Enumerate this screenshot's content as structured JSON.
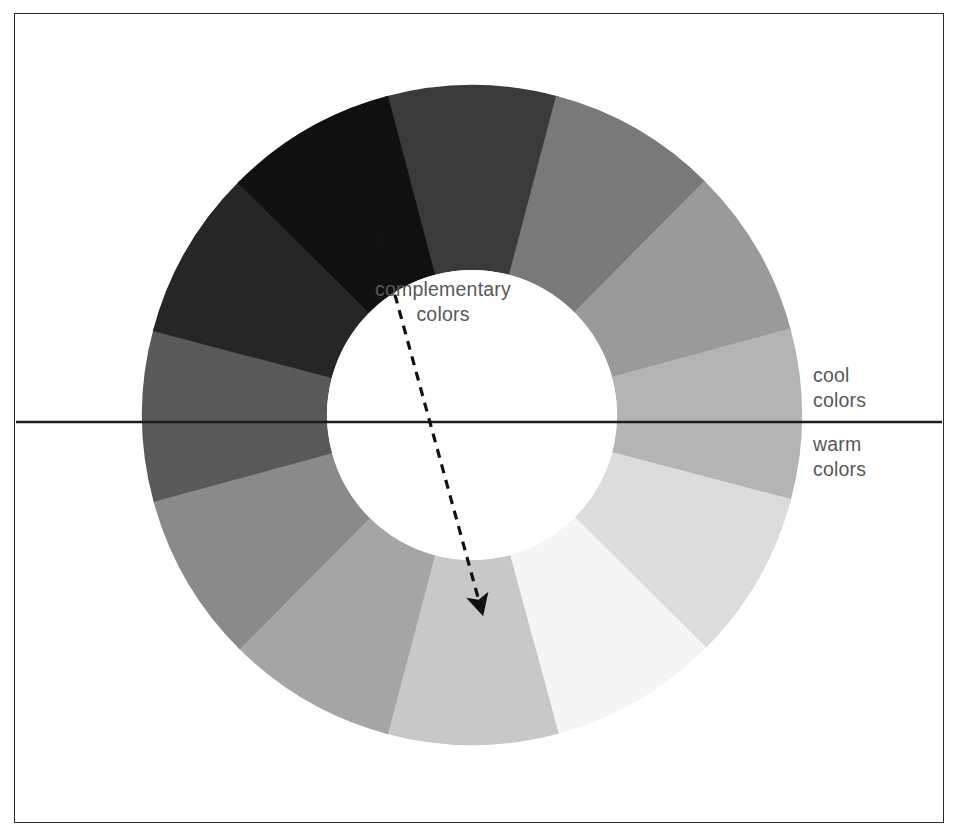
{
  "figure": {
    "background_color": "#ffffff",
    "frame_border_color": "#2b2b2b",
    "label_color": "#585858"
  },
  "labels": {
    "complementary": "complementary\ncolors",
    "cool": "cool\ncolors",
    "warm": "warm\ncolors"
  },
  "chart_data": {
    "type": "pie",
    "xlabel": "",
    "ylabel": "",
    "shape": "donut",
    "center": [
      472,
      415
    ],
    "outer_radius": 330,
    "inner_radius": 145,
    "segment_count": 12,
    "segment_span_degrees": 30,
    "start_angle_degrees": -105,
    "legend_position": "right",
    "grid": false,
    "categories": [
      "seg-1",
      "seg-2",
      "seg-3",
      "seg-4",
      "seg-5",
      "seg-6",
      "seg-7",
      "seg-8",
      "seg-9",
      "seg-10",
      "seg-11",
      "seg-12"
    ],
    "values": [
      30,
      30,
      30,
      30,
      30,
      30,
      30,
      30,
      30,
      30,
      30,
      30
    ],
    "segments": [
      {
        "index": 1,
        "name": "segment-top-left-dark",
        "color": "#3a3a3a",
        "start_deg": -105,
        "end_deg": -75
      },
      {
        "index": 2,
        "name": "segment-top",
        "color": "#797979",
        "start_deg": -75,
        "end_deg": -45
      },
      {
        "index": 3,
        "name": "segment-upper-right",
        "color": "#9a9a9a",
        "start_deg": -45,
        "end_deg": -15
      },
      {
        "index": 4,
        "name": "segment-right-upper",
        "color": "#b4b4b4",
        "start_deg": -15,
        "end_deg": 15
      },
      {
        "index": 5,
        "name": "segment-right-cool",
        "color": "#dcdcdc",
        "start_deg": 15,
        "end_deg": 45
      },
      {
        "index": 6,
        "name": "segment-right-warm-lightest",
        "color": "#f5f5f5",
        "start_deg": 45,
        "end_deg": 75
      },
      {
        "index": 7,
        "name": "segment-lower-right",
        "color": "#c8c8c8",
        "start_deg": 75,
        "end_deg": 105
      },
      {
        "index": 8,
        "name": "segment-bottom-right",
        "color": "#a5a5a5",
        "start_deg": 105,
        "end_deg": 135
      },
      {
        "index": 9,
        "name": "segment-bottom",
        "color": "#8a8a8a",
        "start_deg": 135,
        "end_deg": 165
      },
      {
        "index": 10,
        "name": "segment-bottom-left",
        "color": "#595959",
        "start_deg": 165,
        "end_deg": 195
      },
      {
        "index": 11,
        "name": "segment-left-lower-dark",
        "color": "#262626",
        "start_deg": 195,
        "end_deg": 225
      },
      {
        "index": 12,
        "name": "segment-left-darkest",
        "color": "#101010",
        "start_deg": 225,
        "end_deg": 255
      }
    ],
    "annotations": [
      {
        "name": "divider-line",
        "kind": "horizontal-rule",
        "text": "",
        "y": 422,
        "x_start": 16,
        "x_end": 942,
        "color": "#1c1c1c"
      },
      {
        "name": "complementary-arrow",
        "kind": "dashed-double-arrow",
        "text": "complementary colors",
        "from": [
          378,
          233
        ],
        "to": [
          482,
          612
        ],
        "color": "#111111",
        "dashed": true,
        "arrowheads": "both"
      },
      {
        "name": "cool-colors-label",
        "kind": "text",
        "text": "cool colors",
        "position": [
          813,
          363
        ]
      },
      {
        "name": "warm-colors-label",
        "kind": "text",
        "text": "warm colors",
        "position": [
          813,
          432
        ]
      }
    ]
  }
}
